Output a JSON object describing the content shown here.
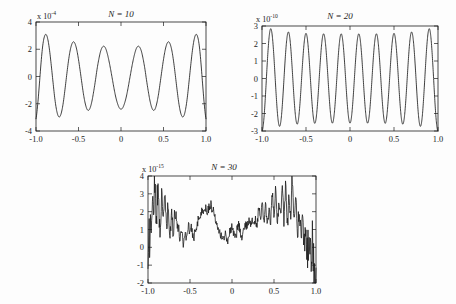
{
  "figure": {
    "background_color": "#fdfdfd",
    "ink_color": "#1c1c1c",
    "panel_count": 3
  },
  "chart_data": [
    {
      "type": "line",
      "id": "panel-n10",
      "title": "N = 10",
      "title_variable": "N",
      "title_value": "10",
      "xlabel": "",
      "ylabel": "",
      "exponent_prefix": "x 10",
      "exponent_value": "-4",
      "y_scale": 0.0001,
      "xlim": [
        -1.0,
        1.0
      ],
      "ylim": [
        -4,
        4
      ],
      "xticks": [
        -1.0,
        -0.5,
        0,
        0.5,
        1.0
      ],
      "xticklabels": [
        "-1.0",
        "-0.5",
        "0",
        "0.5",
        "1.0"
      ],
      "yticks": [
        -4,
        -2,
        0,
        2,
        4
      ],
      "yticklabels": [
        "-4",
        "-2",
        "0",
        "2",
        "4"
      ],
      "grid": false,
      "legend": null,
      "oscillation_count": 5,
      "peak_values": [
        3.1,
        2.55,
        2.2,
        2.6,
        3.1
      ],
      "trough_values": [
        -3.0,
        -2.45,
        -2.45,
        -3.0
      ],
      "endpoint_values": [
        -3.1,
        -3.1
      ],
      "series": [
        {
          "name": "interpolation error",
          "x": [
            -1.0,
            -0.98,
            -0.96,
            -0.94,
            -0.92,
            -0.9,
            -0.88,
            -0.86,
            -0.84,
            -0.82,
            -0.8,
            -0.78,
            -0.76,
            -0.74,
            -0.72,
            -0.7,
            -0.68,
            -0.66,
            -0.64,
            -0.62,
            -0.6,
            -0.58,
            -0.56,
            -0.54,
            -0.52,
            -0.5,
            -0.48,
            -0.46,
            -0.44,
            -0.42,
            -0.4,
            -0.38,
            -0.36,
            -0.34,
            -0.32,
            -0.3,
            -0.28,
            -0.26,
            -0.24,
            -0.22,
            -0.2,
            -0.18,
            -0.16,
            -0.14,
            -0.12,
            -0.1,
            -0.08,
            -0.06,
            -0.04,
            -0.02,
            0.0,
            0.02,
            0.04,
            0.06,
            0.08,
            0.1,
            0.12,
            0.14,
            0.16,
            0.18,
            0.2,
            0.22,
            0.24,
            0.26,
            0.28,
            0.3,
            0.32,
            0.34,
            0.36,
            0.38,
            0.4,
            0.42,
            0.44,
            0.46,
            0.48,
            0.5,
            0.52,
            0.54,
            0.56,
            0.58,
            0.6,
            0.62,
            0.64,
            0.66,
            0.68,
            0.7,
            0.72,
            0.74,
            0.76,
            0.78,
            0.8,
            0.82,
            0.84,
            0.86,
            0.88,
            0.9,
            0.92,
            0.94,
            0.96,
            0.98,
            1.0
          ],
          "values": [
            -3.1,
            -2.05,
            -0.55,
            1.05,
            2.3,
            2.95,
            3.08,
            2.7,
            1.9,
            0.8,
            -0.4,
            -1.55,
            -2.4,
            -2.88,
            -2.95,
            -2.62,
            -1.95,
            -1.0,
            0.05,
            1.05,
            1.85,
            2.35,
            2.55,
            2.4,
            1.95,
            1.25,
            0.4,
            -0.5,
            -1.35,
            -2.0,
            -2.4,
            -2.48,
            -2.25,
            -1.75,
            -1.05,
            -0.25,
            0.6,
            1.3,
            1.85,
            2.15,
            2.22,
            2.05,
            1.65,
            1.1,
            0.45,
            -0.25,
            -0.95,
            -1.55,
            -2.0,
            -2.3,
            -2.4,
            -2.3,
            -2.0,
            -1.55,
            -0.95,
            -0.25,
            0.45,
            1.1,
            1.65,
            2.05,
            2.22,
            2.15,
            1.85,
            1.3,
            0.6,
            -0.25,
            -1.05,
            -1.75,
            -2.25,
            -2.48,
            -2.4,
            -2.0,
            -1.35,
            -0.5,
            0.4,
            1.25,
            1.95,
            2.4,
            2.55,
            2.35,
            1.85,
            1.05,
            0.05,
            -1.0,
            -1.95,
            -2.62,
            -2.95,
            -2.88,
            -2.4,
            -1.55,
            -0.4,
            0.8,
            1.9,
            2.7,
            3.08,
            2.95,
            2.3,
            1.05,
            -0.55,
            -2.05,
            -3.1
          ]
        }
      ]
    },
    {
      "type": "line",
      "id": "panel-n20",
      "title": "N = 20",
      "title_variable": "N",
      "title_value": "20",
      "xlabel": "",
      "ylabel": "",
      "exponent_prefix": "x 10",
      "exponent_value": "-10",
      "y_scale": 1e-10,
      "xlim": [
        -1.0,
        1.0
      ],
      "ylim": [
        -3,
        3
      ],
      "xticks": [
        -1.0,
        -0.5,
        0,
        0.5,
        1.0
      ],
      "xticklabels": [
        "-1.0",
        "-0.5",
        "0",
        "0.5",
        "1.0"
      ],
      "yticks": [
        -3,
        -2,
        -1,
        0,
        1,
        2,
        3
      ],
      "yticklabels": [
        "-3",
        "-2",
        "-1",
        "0",
        "1",
        "2",
        "3"
      ],
      "grid": false,
      "legend": null,
      "oscillation_count": 10,
      "peak_values": [
        3.0,
        2.75,
        2.7,
        2.55,
        2.55,
        2.55,
        2.55,
        2.7,
        2.75,
        3.0
      ],
      "trough_values": [
        -2.95,
        -2.7,
        -2.6,
        -2.5,
        -2.5,
        -2.5,
        -2.6,
        -2.7,
        -2.95
      ],
      "series": [
        {
          "name": "interpolation error",
          "amplitude_envelope_edge": 3.0,
          "amplitude_envelope_center": 2.55,
          "period": 0.2
        }
      ]
    },
    {
      "type": "line",
      "id": "panel-n30",
      "title": "N = 30",
      "title_variable": "N",
      "title_value": "30",
      "xlabel": "",
      "ylabel": "",
      "exponent_prefix": "x 10",
      "exponent_value": "-15",
      "y_scale": 1e-15,
      "xlim": [
        -1.0,
        1.0
      ],
      "ylim": [
        -2,
        4
      ],
      "xticks": [
        -1.0,
        -0.5,
        0,
        0.5,
        1.0
      ],
      "xticklabels": [
        "-1.0",
        "-0.5",
        "0",
        "0.5",
        "1.0"
      ],
      "yticks": [
        -2,
        -1,
        0,
        1,
        2,
        3,
        4
      ],
      "yticklabels": [
        "-2",
        "-1",
        "0",
        "1",
        "2",
        "3",
        "4"
      ],
      "grid": false,
      "legend": null,
      "description": "rounding-error noise band",
      "noise_band": true,
      "edge_spike_max": 4.0,
      "edge_spike_min": -1.9,
      "center_mean": 1.2,
      "center_band_half_width": 0.45,
      "series": [
        {
          "name": "rounding error",
          "x": [
            -1.0,
            -0.98,
            -0.96,
            -0.94,
            -0.92,
            -0.9,
            -0.88,
            -0.86,
            -0.84,
            -0.82,
            -0.8,
            -0.78,
            -0.76,
            -0.74,
            -0.72,
            -0.7,
            -0.68,
            -0.66,
            -0.64,
            -0.62,
            -0.6,
            -0.58,
            -0.56,
            -0.54,
            -0.52,
            -0.5,
            -0.48,
            -0.46,
            -0.44,
            -0.42,
            -0.4,
            -0.38,
            -0.36,
            -0.34,
            -0.32,
            -0.3,
            -0.28,
            -0.26,
            -0.24,
            -0.22,
            -0.2,
            -0.18,
            -0.16,
            -0.14,
            -0.12,
            -0.1,
            -0.08,
            -0.06,
            -0.04,
            -0.02,
            0.0,
            0.02,
            0.04,
            0.06,
            0.08,
            0.1,
            0.12,
            0.14,
            0.16,
            0.18,
            0.2,
            0.22,
            0.24,
            0.26,
            0.28,
            0.3,
            0.32,
            0.34,
            0.36,
            0.38,
            0.4,
            0.42,
            0.44,
            0.46,
            0.48,
            0.5,
            0.52,
            0.54,
            0.56,
            0.58,
            0.6,
            0.62,
            0.64,
            0.66,
            0.68,
            0.7,
            0.72,
            0.74,
            0.76,
            0.78,
            0.8,
            0.82,
            0.84,
            0.86,
            0.88,
            0.9,
            0.92,
            0.94,
            0.96,
            0.98,
            1.0
          ],
          "values": [
            -1.9,
            0.95,
            1.2,
            2.35,
            3.55,
            2.1,
            3.0,
            1.3,
            2.6,
            1.45,
            3.05,
            1.0,
            2.2,
            0.55,
            1.7,
            0.95,
            2.0,
            1.55,
            1.1,
            0.6,
            1.05,
            0.25,
            0.85,
            0.45,
            1.35,
            0.7,
            1.1,
            0.5,
            0.95,
            1.3,
            1.55,
            1.8,
            1.95,
            2.1,
            2.2,
            2.05,
            2.2,
            2.35,
            2.25,
            2.0,
            1.7,
            1.4,
            1.15,
            0.85,
            0.6,
            0.5,
            0.7,
            0.45,
            0.6,
            0.95,
            1.2,
            0.8,
            0.55,
            0.95,
            1.25,
            0.85,
            0.45,
            0.9,
            1.4,
            1.1,
            1.6,
            1.25,
            1.75,
            1.1,
            1.55,
            1.3,
            2.25,
            1.45,
            2.35,
            1.55,
            2.4,
            1.2,
            2.1,
            1.5,
            2.95,
            1.7,
            3.15,
            1.4,
            2.55,
            1.8,
            3.3,
            1.5,
            3.6,
            1.3,
            2.9,
            1.9,
            4.0,
            1.1,
            3.4,
            0.9,
            2.0,
            0.6,
            1.3,
            0.2,
            0.8,
            -0.2,
            1.0,
            -0.6,
            0.4,
            -1.0,
            -1.5
          ]
        }
      ]
    }
  ]
}
